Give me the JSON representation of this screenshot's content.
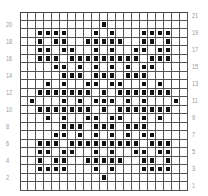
{
  "chart_data": {
    "type": "table",
    "title": "",
    "columns": 21,
    "rows": 21,
    "left_row_labels": [
      "20",
      "18",
      "16",
      "14",
      "12",
      "10",
      "8",
      "6",
      "4",
      "2"
    ],
    "right_row_labels": [
      "21",
      "19",
      "17",
      "15",
      "13",
      "11",
      "9",
      "7",
      "5",
      "3",
      "1"
    ],
    "filled_cells_by_row": {
      "21": [],
      "20": [
        11
      ],
      "19": [
        3,
        4,
        5,
        6,
        10,
        12,
        16,
        17,
        18,
        19
      ],
      "18": [
        3,
        5,
        6,
        9,
        10,
        11,
        12,
        13,
        16,
        17,
        19
      ],
      "17": [
        3,
        4,
        6,
        7,
        10,
        12,
        15,
        16,
        18,
        19
      ],
      "16": [
        3,
        4,
        5,
        7,
        8,
        9,
        10,
        11,
        12,
        13,
        14,
        15,
        17,
        18,
        19
      ],
      "15": [
        5,
        6,
        8,
        10,
        12,
        14,
        16,
        17
      ],
      "14": [
        6,
        7,
        8,
        10,
        11,
        12,
        14,
        15,
        16
      ],
      "13": [
        4,
        6,
        9,
        10,
        12,
        13,
        16,
        18
      ],
      "12": [
        3,
        4,
        5,
        6,
        7,
        8,
        9,
        11,
        13,
        14,
        15,
        16,
        17,
        18,
        19
      ],
      "11": [
        2,
        6,
        8,
        10,
        11,
        12,
        14,
        16,
        20
      ],
      "10": [
        3,
        4,
        5,
        6,
        7,
        8,
        9,
        11,
        13,
        14,
        15,
        16,
        17,
        18,
        19
      ],
      "9": [
        4,
        6,
        9,
        10,
        12,
        13,
        16,
        18
      ],
      "8": [
        6,
        7,
        8,
        10,
        11,
        12,
        14,
        15,
        16
      ],
      "7": [
        5,
        6,
        8,
        10,
        12,
        14,
        16,
        17
      ],
      "6": [
        3,
        4,
        5,
        7,
        8,
        9,
        10,
        11,
        12,
        13,
        14,
        15,
        17,
        18,
        19
      ],
      "5": [
        3,
        4,
        6,
        7,
        10,
        12,
        15,
        16,
        18,
        19
      ],
      "4": [
        3,
        5,
        6,
        9,
        10,
        11,
        12,
        13,
        16,
        17,
        19
      ],
      "3": [
        3,
        4,
        5,
        6,
        10,
        12,
        16,
        17,
        18,
        19
      ],
      "2": [
        11
      ],
      "1": []
    },
    "grid": true,
    "colors": {
      "filled": "#111111",
      "grid_line": "#555555",
      "label": "#999999"
    }
  }
}
